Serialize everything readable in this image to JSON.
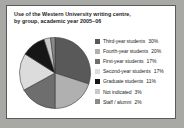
{
  "card": {
    "title_line1": "Use of the Western University writing centre,",
    "title_line2": "by group, academic year 2005–06"
  },
  "chart_data": {
    "type": "pie",
    "title": "Use of the Western University writing centre, by group, academic year 2005–06",
    "xlabel": "",
    "ylabel": "",
    "legend_position": "right",
    "grid": false,
    "start_angle_deg": 0,
    "direction": "clockwise",
    "categories": [
      "Third-year students",
      "Fourth-year students",
      "First-year students",
      "Second-year students",
      "Graduate students",
      "Not indicated",
      "Staff / alumni"
    ],
    "values": [
      30,
      20,
      17,
      17,
      11,
      3,
      2
    ],
    "value_labels": [
      "30%",
      "20%",
      "17%",
      "17%",
      "11%",
      "3%",
      "2%"
    ],
    "colors": [
      "#595959",
      "#b0b0b0",
      "#6e6e6e",
      "#dcdcdc",
      "#161616",
      "#c9c9c9",
      "#8a8a8a"
    ],
    "slice_border_color": "#3a3a3a"
  },
  "legend": {
    "items": [
      {
        "label": "Third-year students",
        "pct": "30%",
        "color": "#595959"
      },
      {
        "label": "Fourth-year students",
        "pct": "20%",
        "color": "#b0b0b0"
      },
      {
        "label": "First-year students",
        "pct": "17%",
        "color": "#6e6e6e"
      },
      {
        "label": "Second-year students",
        "pct": "17%",
        "color": "#dcdcdc"
      },
      {
        "label": "Graduate students",
        "pct": "11%",
        "color": "#161616"
      },
      {
        "label": "Not indicated",
        "pct": "3%",
        "color": "#c9c9c9"
      },
      {
        "label": "Staff / alumni",
        "pct": "2%",
        "color": "#8a8a8a"
      }
    ]
  }
}
